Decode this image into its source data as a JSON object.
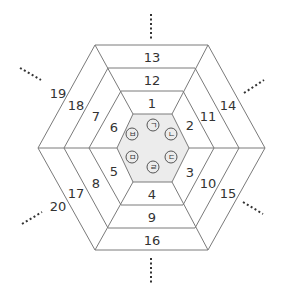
{
  "colors": {
    "line": "#7a7a7a",
    "inner_fill": "#ececec",
    "text": "#333333",
    "dots": "#333333"
  },
  "center_labels": [
    "ㄱ",
    "ㄴ",
    "ㄷ",
    "ㄹ",
    "ㅁ",
    "ㅂ"
  ],
  "ring1": {
    "top": "1",
    "upper_right": "2",
    "lower_right": "3",
    "bottom": "4",
    "lower_left": "5",
    "upper_left": "6"
  },
  "ring2": {
    "top": "12",
    "upper_right": "11",
    "lower_right": "10",
    "bottom": "9",
    "lower_left": "8",
    "upper_left": "7"
  },
  "ring3": {
    "top": "13",
    "upper_right": "14",
    "lower_right": "15",
    "bottom": "16",
    "lower_left": "17",
    "upper_left": "18"
  },
  "outer": {
    "upper_left": "19",
    "lower_left": "20"
  }
}
